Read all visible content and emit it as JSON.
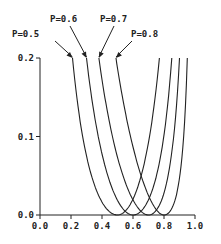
{
  "chart_data": {
    "type": "line",
    "title": "",
    "xlabel": "",
    "ylabel": "",
    "xlim": [
      0.0,
      1.0
    ],
    "ylim": [
      0.0,
      0.2
    ],
    "x_ticks": [
      "0.0",
      "0.2",
      "0.4",
      "0.6",
      "0.8",
      "1.0"
    ],
    "y_ticks": [
      "0.0",
      "0.1",
      "0.2"
    ],
    "grid": false,
    "legend": "none; curves labelled by arrow annotations",
    "annotations": [
      "P=0.5",
      "P=0.6",
      "P=0.7",
      "P=0.8"
    ],
    "series": [
      {
        "name": "P=0.5",
        "min_x": 0.5,
        "left_top_x": 0.21,
        "right_top_x": 0.77,
        "x": [
          0.21,
          0.25,
          0.3,
          0.35,
          0.4,
          0.45,
          0.5,
          0.55,
          0.6,
          0.65,
          0.7,
          0.75,
          0.77
        ],
        "y": [
          0.2,
          0.167,
          0.095,
          0.055,
          0.024,
          0.006,
          0.0,
          0.006,
          0.024,
          0.06,
          0.11,
          0.18,
          0.2
        ]
      },
      {
        "name": "P=0.6",
        "min_x": 0.6,
        "left_top_x": 0.3,
        "right_top_x": 0.85,
        "x": [
          0.3,
          0.35,
          0.4,
          0.45,
          0.5,
          0.55,
          0.6,
          0.65,
          0.7,
          0.75,
          0.8,
          0.85
        ],
        "y": [
          0.2,
          0.14,
          0.085,
          0.045,
          0.02,
          0.005,
          0.0,
          0.006,
          0.025,
          0.06,
          0.12,
          0.2
        ]
      },
      {
        "name": "P=0.7",
        "min_x": 0.7,
        "left_top_x": 0.38,
        "right_top_x": 0.9,
        "x": [
          0.38,
          0.45,
          0.5,
          0.55,
          0.6,
          0.65,
          0.7,
          0.75,
          0.8,
          0.85,
          0.9
        ],
        "y": [
          0.2,
          0.12,
          0.08,
          0.045,
          0.02,
          0.005,
          0.0,
          0.008,
          0.035,
          0.1,
          0.2
        ]
      },
      {
        "name": "P=0.8",
        "min_x": 0.8,
        "left_top_x": 0.49,
        "right_top_x": 0.95,
        "x": [
          0.49,
          0.55,
          0.6,
          0.65,
          0.7,
          0.75,
          0.8,
          0.85,
          0.9,
          0.95
        ],
        "y": [
          0.2,
          0.13,
          0.085,
          0.05,
          0.02,
          0.005,
          0.0,
          0.012,
          0.06,
          0.2
        ]
      }
    ]
  }
}
